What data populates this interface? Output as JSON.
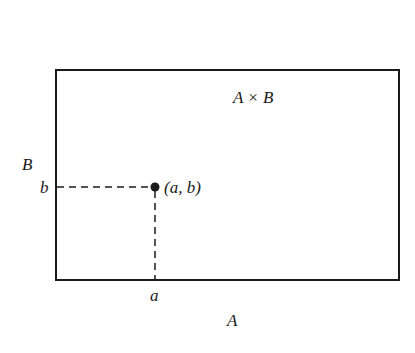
{
  "diagram": {
    "title_label": "A × B",
    "axis_labels": {
      "horizontal_set": "A",
      "vertical_set": "B",
      "x_value": "a",
      "y_value": "b"
    },
    "point_label": "(a, b)",
    "colors": {
      "stroke": "#1a1a1a",
      "background": "#ffffff"
    },
    "rectangle": {
      "left": 56,
      "top": 70,
      "right": 399,
      "bottom": 280
    },
    "point": {
      "x": 155,
      "y": 187
    }
  }
}
